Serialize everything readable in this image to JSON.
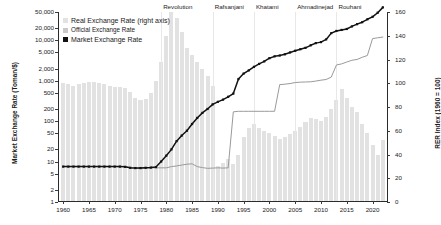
{
  "chart_data": {
    "type": "line",
    "title": "",
    "subtitle": "",
    "xlabel": "",
    "ylabel": "Market Exchange Rate (Toman/$)",
    "ylabel_right": "RER Index (1960 = 100)",
    "x_range": [
      1959,
      2023
    ],
    "yscale_left": "log",
    "ylim_left": [
      1,
      50000
    ],
    "ylim_right": [
      0,
      160
    ],
    "grid": false,
    "legend_position": "top-left",
    "left_ticks": [
      1,
      2,
      5,
      10,
      20,
      50,
      100,
      200,
      500,
      1000,
      2000,
      5000,
      10000,
      20000,
      50000
    ],
    "left_tick_labels": [
      "1",
      "2",
      "5",
      "10",
      "20",
      "50",
      "100",
      "200",
      "500",
      "1,000",
      "2,000",
      "5,000",
      "10,000",
      "20,000",
      "50,000"
    ],
    "right_ticks": [
      0,
      20,
      40,
      60,
      80,
      100,
      120,
      140,
      160
    ],
    "right_tick_labels": [
      "0",
      "20",
      "40",
      "60",
      "80",
      "100",
      "120",
      "140",
      "160"
    ],
    "x_ticks": [
      1960,
      1965,
      1970,
      1975,
      1980,
      1985,
      1990,
      1995,
      2000,
      2005,
      2010,
      2015,
      2020
    ],
    "x_tick_labels": [
      "1960",
      "1965",
      "1970",
      "1975",
      "1980",
      "1985",
      "1990",
      "1995",
      "2000",
      "2005",
      "2010",
      "2015",
      "2020"
    ],
    "annotations": [
      {
        "label": "Revolution",
        "x": 1979
      },
      {
        "label": "Rafsanjani",
        "x": 1989
      },
      {
        "label": "Khatami",
        "x": 1997
      },
      {
        "label": "Ahmadinejad",
        "x": 2005
      },
      {
        "label": "Rouhani",
        "x": 2013
      }
    ],
    "series": [
      {
        "name": "Real Exchange Rate (right axis)",
        "type": "bar",
        "axis": "right",
        "color": "#e2e2e2",
        "x": [
          1960,
          1961,
          1962,
          1963,
          1964,
          1965,
          1966,
          1967,
          1968,
          1969,
          1970,
          1971,
          1972,
          1973,
          1974,
          1975,
          1976,
          1977,
          1978,
          1979,
          1980,
          1981,
          1982,
          1983,
          1984,
          1985,
          1986,
          1987,
          1988,
          1989,
          1990,
          1991,
          1992,
          1993,
          1994,
          1995,
          1996,
          1997,
          1998,
          1999,
          2000,
          2001,
          2002,
          2003,
          2004,
          2005,
          2006,
          2007,
          2008,
          2009,
          2010,
          2011,
          2012,
          2013,
          2014,
          2015,
          2016,
          2017,
          2018,
          2019,
          2020,
          2021,
          2022
        ],
        "values": [
          100,
          99,
          98,
          99,
          100,
          101,
          101,
          100,
          99,
          98,
          97,
          97,
          96,
          93,
          88,
          86,
          87,
          92,
          102,
          118,
          140,
          160,
          155,
          143,
          130,
          124,
          118,
          112,
          106,
          98,
          30,
          33,
          36,
          32,
          40,
          55,
          62,
          66,
          62,
          60,
          58,
          56,
          53,
          55,
          57,
          60,
          63,
          67,
          71,
          70,
          68,
          72,
          78,
          86,
          95,
          88,
          80,
          76,
          66,
          58,
          48,
          40,
          52
        ]
      },
      {
        "name": "Official Exchange Rate",
        "type": "line",
        "axis": "left",
        "color": "#9a9a9a",
        "x": [
          1960,
          1961,
          1962,
          1963,
          1964,
          1965,
          1966,
          1967,
          1968,
          1969,
          1970,
          1971,
          1972,
          1973,
          1974,
          1975,
          1976,
          1977,
          1978,
          1979,
          1980,
          1981,
          1982,
          1983,
          1984,
          1985,
          1986,
          1987,
          1988,
          1989,
          1990,
          1991,
          1992,
          1993,
          1994,
          1995,
          1996,
          1997,
          1998,
          1999,
          2000,
          2001,
          2002,
          2003,
          2004,
          2005,
          2006,
          2007,
          2008,
          2009,
          2010,
          2011,
          2012,
          2013,
          2014,
          2015,
          2016,
          2017,
          2018,
          2019,
          2020,
          2021,
          2022
        ],
        "values": [
          7.5,
          7.5,
          7.5,
          7.5,
          7.5,
          7.5,
          7.5,
          7.5,
          7.5,
          7.5,
          7.5,
          7.5,
          7.5,
          7.0,
          6.8,
          6.8,
          7.0,
          7.0,
          7.0,
          7.0,
          7.0,
          7.5,
          7.8,
          8.2,
          8.6,
          8.8,
          7.5,
          7.1,
          6.8,
          6.9,
          7.0,
          6.9,
          7.0,
          170,
          175,
          175,
          175,
          175,
          175,
          175,
          175,
          175,
          800,
          820,
          850,
          900,
          920,
          930,
          940,
          980,
          1030,
          1070,
          1230,
          2450,
          2600,
          2900,
          3200,
          3350,
          3800,
          4200,
          11000,
          11500,
          12000
        ]
      },
      {
        "name": "Market Exchange Rate",
        "type": "line",
        "axis": "left",
        "color": "#121212",
        "x": [
          1960,
          1961,
          1962,
          1963,
          1964,
          1965,
          1966,
          1967,
          1968,
          1969,
          1970,
          1971,
          1972,
          1973,
          1974,
          1975,
          1976,
          1977,
          1978,
          1979,
          1980,
          1981,
          1982,
          1983,
          1984,
          1985,
          1986,
          1987,
          1988,
          1989,
          1990,
          1991,
          1992,
          1993,
          1994,
          1995,
          1996,
          1997,
          1998,
          1999,
          2000,
          2001,
          2002,
          2003,
          2004,
          2005,
          2006,
          2007,
          2008,
          2009,
          2010,
          2011,
          2012,
          2013,
          2014,
          2015,
          2016,
          2017,
          2018,
          2019,
          2020,
          2021,
          2022
        ],
        "values": [
          7.5,
          7.5,
          7.5,
          7.5,
          7.5,
          7.5,
          7.5,
          7.5,
          7.5,
          7.5,
          7.5,
          7.5,
          7.4,
          7.0,
          6.9,
          6.9,
          7.0,
          7.1,
          7.3,
          10,
          14,
          20,
          32,
          44,
          58,
          85,
          120,
          160,
          200,
          260,
          300,
          340,
          400,
          480,
          1100,
          1500,
          1800,
          2200,
          2600,
          3000,
          3600,
          4000,
          4200,
          4500,
          5000,
          5500,
          6000,
          6500,
          7500,
          8500,
          9000,
          10500,
          15000,
          17000,
          18000,
          19000,
          22000,
          25000,
          28000,
          33000,
          38000,
          48000,
          65000
        ]
      }
    ]
  },
  "legend": {
    "items": [
      {
        "label": "Real Exchange Rate (right axis)",
        "color": "#e2e2e2"
      },
      {
        "label": "Official Exchange Rate",
        "color": "#c9c9c9"
      },
      {
        "label": "Market Exchange Rate",
        "color": "#121212"
      }
    ]
  }
}
